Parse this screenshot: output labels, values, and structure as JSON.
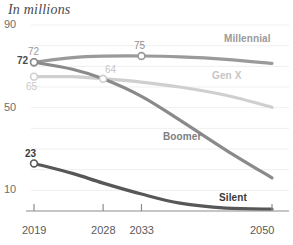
{
  "chart_data": {
    "type": "line",
    "title": "In millions",
    "xlabel": "",
    "ylabel": "",
    "xlim": [
      2019,
      2050
    ],
    "ylim": [
      0,
      90
    ],
    "grid": true,
    "grid_step": 10,
    "legend_position": "inline-right",
    "x_ticks": [
      "2019",
      "2028",
      "2033",
      "2050"
    ],
    "x_tick_values": [
      2019,
      2028,
      2033,
      2050
    ],
    "y_ticks": [
      "90",
      "50",
      "10"
    ],
    "y_tick_values": [
      90,
      50,
      10
    ],
    "series": [
      {
        "name": "Millennial",
        "color": "#9a9a9a",
        "label_color": "#8e8e8e",
        "x": [
          2019,
          2024,
          2028,
          2033,
          2038,
          2044,
          2050
        ],
        "values": [
          72,
          74.2,
          74.9,
          75,
          74.6,
          73.4,
          71.4
        ],
        "points": [
          {
            "x": 2019,
            "y": 72,
            "label": "72",
            "label_color": "#9a9a9a",
            "bold": false
          },
          {
            "x": 2033,
            "y": 75,
            "label": "75",
            "label_color": "#8e8e8e",
            "bold": false
          }
        ]
      },
      {
        "name": "Gen X",
        "color": "#cfcfcf",
        "label_color": "#c6c6c6",
        "x": [
          2019,
          2024,
          2028,
          2033,
          2038,
          2044,
          2050
        ],
        "values": [
          65,
          65,
          64,
          62.4,
          60,
          56,
          50.2
        ],
        "points": [
          {
            "x": 2019,
            "y": 65,
            "label": "65",
            "label_color": "#c9c9c9",
            "bold": false
          },
          {
            "x": 2028,
            "y": 64,
            "label": "64",
            "label_color": "#c6c6c6",
            "bold": false
          }
        ]
      },
      {
        "name": "Boomer",
        "color": "#8a8a8a",
        "label_color": "#7e7e7e",
        "x": [
          2019,
          2024,
          2028,
          2033,
          2038,
          2044,
          2050
        ],
        "values": [
          72,
          68.6,
          64,
          55.5,
          44,
          29.5,
          16
        ],
        "points": [
          {
            "x": 2019,
            "y": 72,
            "label": "72",
            "label_color": "#4a4a4a",
            "bold": true
          }
        ]
      },
      {
        "name": "Silent",
        "color": "#575757",
        "label_color": "#3c3c3c",
        "x": [
          2019,
          2024,
          2028,
          2033,
          2038,
          2044,
          2050
        ],
        "values": [
          23,
          18.2,
          13.5,
          8.2,
          3.8,
          1.4,
          0.9
        ],
        "points": [
          {
            "x": 2019,
            "y": 23,
            "label": "23",
            "label_color": "#3a3a3a",
            "bold": true
          }
        ]
      }
    ],
    "series_labels": [
      {
        "name": "Millennial",
        "color": "#8e8e8e"
      },
      {
        "name": "Gen X",
        "color": "#c6c6c6"
      },
      {
        "name": "Boomer",
        "color": "#7e7e7e"
      },
      {
        "name": "Silent",
        "color": "#3a3a3a"
      }
    ]
  },
  "axis": {
    "title": "In millions",
    "y": {
      "t0": "90",
      "t1": "50",
      "t2": "10"
    },
    "x": {
      "t0": "2019",
      "t1": "2028",
      "t2": "2033",
      "t3": "2050"
    }
  },
  "labels": {
    "millennial": "Millennial",
    "genx": "Gen X",
    "boomer": "Boomer",
    "silent": "Silent",
    "mill_2019": "72",
    "mill_2033": "75",
    "genx_2019": "65",
    "genx_2028": "64",
    "boomer_2019": "72",
    "silent_2019": "23"
  },
  "colors": {
    "millennial": "#9a9a9a",
    "genx": "#cfcfcf",
    "boomer": "#8a8a8a",
    "silent": "#575757",
    "axis": "#8c8c8c",
    "grid": "#efefef"
  }
}
